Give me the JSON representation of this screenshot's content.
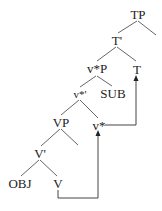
{
  "diagram": {
    "type": "syntax-tree",
    "nodes": {
      "tp": "TP",
      "t_bar": "T'",
      "v_star_p": "v*P",
      "t": "T",
      "v_star_bar": "v*'",
      "sub": "SUB",
      "vp": "VP",
      "v_star": "v*",
      "v_bar": "V'",
      "obj": "OBJ",
      "v": "V"
    },
    "edges": [
      [
        "TP",
        "T'"
      ],
      [
        "TP",
        "(empty)"
      ],
      [
        "T'",
        "v*P"
      ],
      [
        "T'",
        "T"
      ],
      [
        "v*P",
        "v*'"
      ],
      [
        "v*P",
        "SUB"
      ],
      [
        "v*'",
        "VP"
      ],
      [
        "v*'",
        "v*"
      ],
      [
        "VP",
        "V'"
      ],
      [
        "VP",
        "(empty)"
      ],
      [
        "V'",
        "OBJ"
      ],
      [
        "V'",
        "V"
      ]
    ],
    "movement_arrows": [
      {
        "from": "V",
        "to": "v*"
      },
      {
        "from": "v*",
        "to": "T"
      }
    ],
    "line_color": "#555555"
  }
}
